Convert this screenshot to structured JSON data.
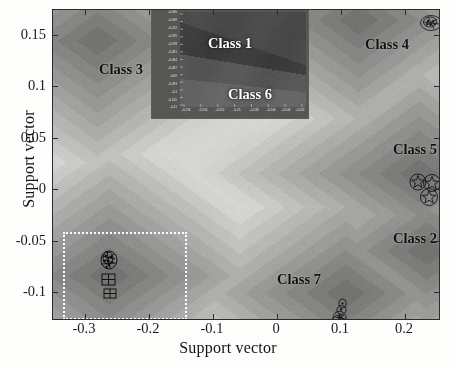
{
  "figure": {
    "axis_titles": {
      "x": "Support vector",
      "y": "Support vector"
    },
    "frame_color": "#2b2b2b",
    "background_color": "#b9b9b4"
  },
  "chart_data": {
    "type": "scatter",
    "title": "",
    "xlabel": "Support vector",
    "ylabel": "Support vector",
    "xlim": [
      -0.335,
      0.265
    ],
    "ylim": [
      -0.125,
      0.175
    ],
    "xticks": [
      -0.3,
      -0.2,
      -0.1,
      0,
      0.1,
      0.2
    ],
    "xticklabels": [
      "-0.3",
      "-0.2",
      "-0.1",
      "0",
      "0.1",
      "0.2"
    ],
    "yticks": [
      -0.1,
      -0.05,
      0,
      0.05,
      0.1,
      0.15
    ],
    "yticklabels": [
      "-0.1",
      "-0.05",
      "0",
      "0.05",
      "0.1",
      "0.15"
    ],
    "grid": false,
    "legend": "none",
    "background": "grayscale contour density field",
    "annotations": [
      {
        "label": "Class 3",
        "x": -0.262,
        "y": 0.1165,
        "color": "#111111",
        "inset": false
      },
      {
        "label": "Class 4",
        "x": 0.152,
        "y": 0.1405,
        "color": "#111111",
        "inset": false
      },
      {
        "label": "Class 5",
        "x": 0.196,
        "y": 0.0385,
        "color": "#111111",
        "inset": false
      },
      {
        "label": "Class 2",
        "x": 0.196,
        "y": -0.048,
        "color": "#111111",
        "inset": false
      },
      {
        "label": "Class 7",
        "x": 0.078,
        "y": -0.088,
        "color": "#111111",
        "inset": false
      },
      {
        "label": "Class 1",
        "x": -0.2525,
        "y": -0.0745,
        "color": "#ffffff",
        "inset": true
      },
      {
        "label": "Class 6",
        "x": -0.2415,
        "y": -0.1015,
        "color": "#ffffff",
        "inset": true
      }
    ],
    "clusters": [
      {
        "name": "Class 3",
        "x": -0.2665,
        "y": 0.1455,
        "n_points": 9,
        "marker": "circled-glyph"
      },
      {
        "name": "Class 4",
        "x": 0.1395,
        "y": 0.1655,
        "n_points": 7,
        "marker": "circled-glyph"
      },
      {
        "name": "Class 5",
        "x": 0.2335,
        "y": 0.0165,
        "n_points": 8,
        "marker": "circled-star"
      },
      {
        "name": "Class 2",
        "x": 0.2455,
        "y": -0.0585,
        "n_points": 5,
        "marker": "circled-glyph"
      },
      {
        "name": "Class 7",
        "x": 0.1195,
        "y": -0.0995,
        "n_points": 6,
        "marker": "circled-glyph"
      },
      {
        "name": "Class 1/6",
        "x": -0.2485,
        "y": -0.0825,
        "n_points": 12,
        "marker": "circled-glyph"
      }
    ],
    "selection_box": {
      "label": "zoom region",
      "x0": -0.3115,
      "x1": -0.1245,
      "y0": -0.1215,
      "y1": -0.0405,
      "style": "white dotted rectangle",
      "color": "#ffffff"
    },
    "inset": {
      "title": "",
      "xlim": [
        -0.2565,
        -0.2395
      ],
      "ylim": [
        -0.113,
        -0.0655
      ],
      "xticklabels": [
        "-0.256",
        "-0.254",
        "-0.252",
        "-0.25",
        "-0.248",
        "-0.246",
        "-0.244",
        "-0.242"
      ],
      "yticklabels": [
        "-0.066",
        "-0.069",
        "-0.072",
        "-0.075",
        "-0.078",
        "-0.081",
        "-0.084",
        "-0.087",
        "-0.09",
        "-0.093",
        "-0.1",
        "-0.105",
        "-0.11"
      ],
      "classes": [
        "Class 1",
        "Class 6"
      ],
      "background": "dark grayscale contour field"
    }
  }
}
